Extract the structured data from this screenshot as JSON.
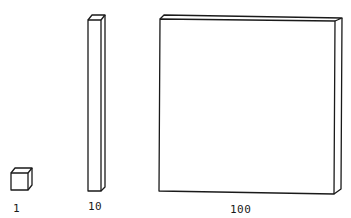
{
  "diagram": {
    "type": "base-ten-blocks",
    "items": [
      {
        "name": "unit-cube",
        "label": "1"
      },
      {
        "name": "ten-rod",
        "label": "10"
      },
      {
        "name": "hundred-flat",
        "label": "100"
      }
    ],
    "colors": {
      "stroke": "#1a1a1a",
      "background": "#ffffff"
    }
  }
}
